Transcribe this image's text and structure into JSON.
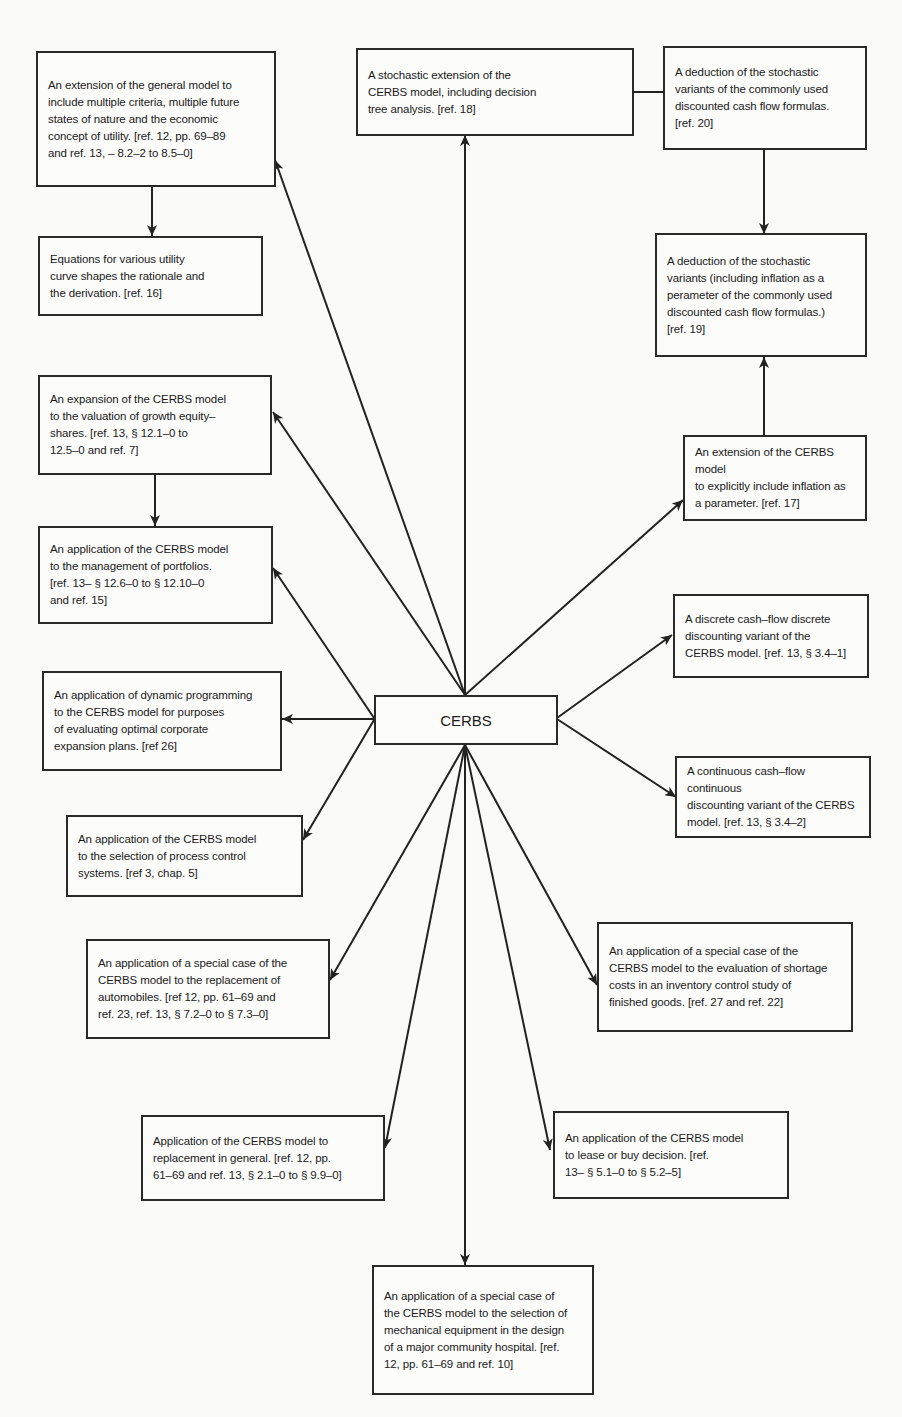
{
  "center": {
    "label": "CERBS"
  },
  "nodes": [
    {
      "id": "multi-criteria",
      "text": "An extension of the general model to\ninclude multiple criteria, multiple future\nstates of nature and the economic\nconcept of utility. [ref. 12, pp. 69–89\nand ref. 13, – 8.2–2 to 8.5–0]"
    },
    {
      "id": "stochastic-extension",
      "text": "A stochastic extension of the\nCERBS model, including decision\ntree analysis. [ref. 18]"
    },
    {
      "id": "stochastic-deduction",
      "text": "A deduction of the stochastic\nvariants of the commonly used\ndiscounted cash flow formulas.\n[ref. 20]"
    },
    {
      "id": "utility-curves",
      "text": "Equations for various utility\ncurve shapes the rationale and\nthe derivation. [ref. 16]"
    },
    {
      "id": "stochastic-inflation",
      "text": "A deduction of the stochastic\nvariants (including inflation as a\nperameter of the commonly used\ndiscounted cash flow formulas.)\n[ref. 19]"
    },
    {
      "id": "growth-equity",
      "text": "An expansion of the CERBS model\nto the valuation of growth equity–\nshares. [ref. 13,  § 12.1–0 to\n   12.5–0 and ref. 7]"
    },
    {
      "id": "inflation-extension",
      "text": "An extension of the CERBS model\nto explicitly include inflation as\na parameter. [ref. 17]"
    },
    {
      "id": "portfolios",
      "text": "An application of the CERBS model\nto the management of portfolios.\n[ref. 13– § 12.6–0 to  § 12.10–0\nand ref. 15]"
    },
    {
      "id": "discrete-variant",
      "text": "A discrete cash–flow discrete\ndiscounting variant of the\nCERBS model. [ref. 13, § 3.4–1]"
    },
    {
      "id": "dynamic-programming",
      "text": "An application of dynamic programming\nto the CERBS model for purposes\nof evaluating optimal corporate\nexpansion plans. [ref 26]"
    },
    {
      "id": "continuous-variant",
      "text": "A continuous cash–flow continuous\ndiscounting variant of the CERBS\nmodel. [ref. 13, § 3.4–2]"
    },
    {
      "id": "process-control",
      "text": "An application of the CERBS model\nto the selection of process control\nsystems. [ref 3, chap. 5]"
    },
    {
      "id": "automobiles",
      "text": "An application of a special case of the\nCERBS model to the replacement of\nautomobiles. [ref 12, pp. 61–69 and\nref. 23, ref. 13, § 7.2–0 to § 7.3–0]"
    },
    {
      "id": "inventory-shortage",
      "text": "An application of a special case of the\nCERBS model to the evaluation of shortage\ncosts in an inventory control study of\nfinished goods. [ref. 27 and ref. 22]"
    },
    {
      "id": "replacement-general",
      "text": "Application of the CERBS model to\nreplacement in general. [ref. 12, pp.\n61–69 and ref. 13, § 2.1–0 to § 9.9–0]"
    },
    {
      "id": "lease-or-buy",
      "text": "An application of the CERBS model\nto lease or buy decision. [ref.\n13– § 5.1–0 to § 5.2–5]"
    },
    {
      "id": "hospital-equipment",
      "text": "An application of a special case of\nthe CERBS model to the selection of\nmechanical equipment in the design\nof a major community hospital. [ref.\n12, pp. 61–69 and ref. 10]"
    }
  ],
  "edges": [
    {
      "from": "CERBS",
      "to": "multi-criteria"
    },
    {
      "from": "CERBS",
      "to": "stochastic-extension"
    },
    {
      "from": "stochastic-extension",
      "to": "stochastic-deduction"
    },
    {
      "from": "multi-criteria",
      "to": "utility-curves"
    },
    {
      "from": "stochastic-deduction",
      "to": "stochastic-inflation"
    },
    {
      "from": "inflation-extension",
      "to": "stochastic-inflation"
    },
    {
      "from": "CERBS",
      "to": "growth-equity"
    },
    {
      "from": "growth-equity",
      "to": "portfolios"
    },
    {
      "from": "CERBS",
      "to": "inflation-extension"
    },
    {
      "from": "CERBS",
      "to": "portfolios"
    },
    {
      "from": "CERBS",
      "to": "discrete-variant"
    },
    {
      "from": "CERBS",
      "to": "dynamic-programming"
    },
    {
      "from": "CERBS",
      "to": "continuous-variant"
    },
    {
      "from": "CERBS",
      "to": "process-control"
    },
    {
      "from": "CERBS",
      "to": "automobiles"
    },
    {
      "from": "CERBS",
      "to": "inventory-shortage"
    },
    {
      "from": "CERBS",
      "to": "replacement-general"
    },
    {
      "from": "CERBS",
      "to": "lease-or-buy"
    },
    {
      "from": "CERBS",
      "to": "hospital-equipment"
    }
  ]
}
